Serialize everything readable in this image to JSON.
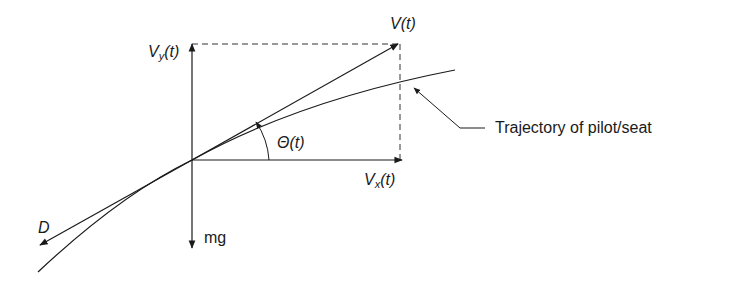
{
  "diagram": {
    "labels": {
      "v": "V(t)",
      "vy_main": "V",
      "vy_sub": "y",
      "vy_tail": "(t)",
      "vx_main": "V",
      "vx_sub": "x",
      "vx_tail": "(t)",
      "theta": "Θ(t)",
      "drag": "D",
      "weight": "mg",
      "trajectory": "Trajectory of pilot/seat"
    },
    "colors": {
      "line": "#1a1a1a",
      "background": "#ffffff"
    }
  }
}
